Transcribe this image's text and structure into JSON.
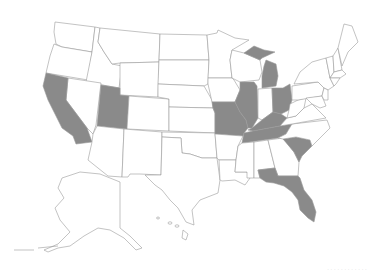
{
  "map": {
    "title": "United States map with highlighted states",
    "colors": {
      "highlighted": "#8a8a8a",
      "default": "#ffffff",
      "border": "#9a9a9a"
    },
    "highlighted_states": [
      "California",
      "Utah",
      "Missouri",
      "Illinois",
      "Michigan",
      "Ohio",
      "Kentucky",
      "Tennessee",
      "South Carolina",
      "Florida"
    ],
    "attribution": "· · · · · · · · · · · ·"
  }
}
